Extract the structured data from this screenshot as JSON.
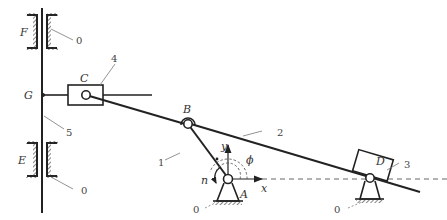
{
  "diagram": {
    "type": "mechanism-kinematic-scheme",
    "points": {
      "F": "F",
      "G": "G",
      "E": "E",
      "C": "C",
      "B": "B",
      "A": "A",
      "D": "D"
    },
    "links": {
      "ground_F": "0",
      "ground_E": "0",
      "ground_A": "0",
      "ground_D": "0",
      "crank": "1",
      "coupler": "2",
      "slider_D": "3",
      "slider_C": "4",
      "rod": "5"
    },
    "axes": {
      "x": "x",
      "y": "y"
    },
    "angle": "ϕ",
    "speed": "n",
    "colors": {
      "line": "#222222",
      "leader": "#777777",
      "dashed": "#555555"
    }
  }
}
